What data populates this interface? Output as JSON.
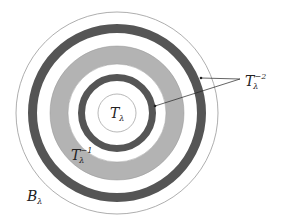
{
  "diagram": {
    "center": [
      117,
      113
    ],
    "colors": {
      "dark": "#555555",
      "gray": "#b3b3b3",
      "line": "#888888",
      "bg": "#ffffff",
      "arrow": "#222222"
    },
    "rings": [
      {
        "name": "outer-boundary-circle",
        "r": 101
      },
      {
        "name": "outer-dark-ring",
        "r_outer": 89,
        "r_inner": 80
      },
      {
        "name": "gray-ring",
        "r_outer": 67,
        "r_inner": 49
      },
      {
        "name": "inner-dark-ring",
        "r_outer": 39,
        "r_inner": 32
      },
      {
        "name": "inner-circle",
        "r": 19
      }
    ],
    "labels": {
      "t_lambda": {
        "base": "T",
        "sub": "λ",
        "sup": ""
      },
      "t_lambda_inv1": {
        "base": "T",
        "sub": "λ",
        "sup": "−1"
      },
      "t_lambda_inv2": {
        "base": "T",
        "sub": "λ",
        "sup": "−2"
      },
      "b_lambda": {
        "base": "B",
        "sub": "λ",
        "sup": ""
      }
    }
  }
}
